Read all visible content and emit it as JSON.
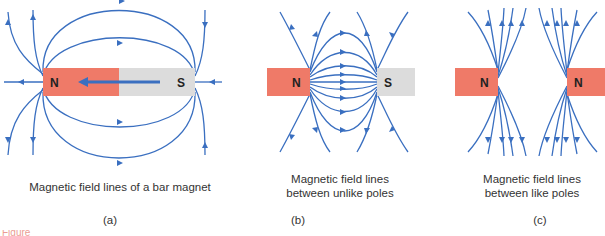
{
  "figure": {
    "colors": {
      "field_line": "#3a6fc0",
      "north_pole": "#ef7a68",
      "south_pole": "#dcdcdc",
      "label_text": "#333333",
      "footer_text": "#e05a4a"
    },
    "panels": [
      {
        "id": "a",
        "label": "(a)",
        "caption": "Magnetic field lines of a bar magnet",
        "magnet": {
          "left_pole": "N",
          "right_pole": "S",
          "internal_arrow": "S-to-N"
        }
      },
      {
        "id": "b",
        "label": "(b)",
        "caption_line1": "Magnetic field lines",
        "caption_line2": "between unlike poles",
        "magnets": [
          {
            "pole": "N"
          },
          {
            "pole": "S"
          }
        ]
      },
      {
        "id": "c",
        "label": "(c)",
        "caption_line1": "Magnetic field lines",
        "caption_line2": "between like poles",
        "magnets": [
          {
            "pole": "N"
          },
          {
            "pole": "N"
          }
        ]
      }
    ],
    "footer_fragment": "Figure"
  }
}
